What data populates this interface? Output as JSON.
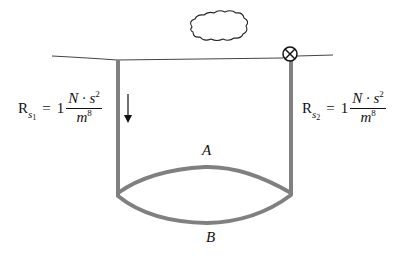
{
  "diagram": {
    "colors": {
      "pipe": "#808080",
      "line": "#333333",
      "text": "#111111"
    },
    "labels": {
      "branch_a": "A",
      "branch_b": "B"
    },
    "left_shaft": {
      "resistance_symbol": "R",
      "resistance_sub": "s",
      "resistance_sub_index": "1",
      "equals": "=",
      "coefficient": "1",
      "numerator_base": "N · s",
      "numerator_exp": "2",
      "denominator_base": "m",
      "denominator_exp": "8",
      "flow_direction": "down"
    },
    "right_shaft": {
      "resistance_symbol": "R",
      "resistance_sub": "s",
      "resistance_sub_index": "2",
      "equals": "=",
      "coefficient": "1",
      "numerator_base": "N · s",
      "numerator_exp": "2",
      "denominator_base": "m",
      "denominator_exp": "8",
      "valve": "closed-valve-symbol"
    },
    "icons": {
      "cloud": "cloud-icon",
      "valve": "valve-icon",
      "arrow": "arrow-down-icon"
    }
  }
}
